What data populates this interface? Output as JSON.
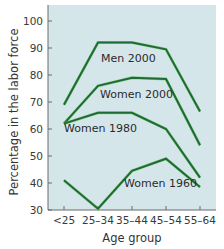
{
  "chart_data": {
    "type": "line",
    "title": "",
    "xlabel": "Age group",
    "ylabel": "Percentage in the labor force",
    "categories": [
      "<25",
      "25–34",
      "35–44",
      "45–54",
      "55–64"
    ],
    "yticks": [
      30,
      40,
      50,
      60,
      70,
      80,
      90,
      100
    ],
    "ylim": [
      30,
      100
    ],
    "grid": false,
    "legend": "inline labels",
    "series": [
      {
        "name": "Men 2000",
        "values": [
          69,
          92,
          92,
          89.5,
          66.5
        ]
      },
      {
        "name": "Women 2000",
        "values": [
          62,
          76,
          79,
          78.5,
          54
        ]
      },
      {
        "name": "Women 1980",
        "values": [
          62,
          66,
          66,
          60,
          42
        ]
      },
      {
        "name": "Women 1960",
        "values": [
          41,
          30.5,
          44.5,
          49,
          38.5
        ]
      }
    ],
    "colors": {
      "plot_background": "#d5e6ea",
      "line": "#1f6b35",
      "line_highlight": "#5cbf4a",
      "axis": "#6a6a6a"
    }
  },
  "labels": {
    "series": [
      {
        "text": "Men 2000",
        "x": 101,
        "y": 62
      },
      {
        "text": "Women 2000",
        "x": 100,
        "y": 98
      },
      {
        "text": "Women 1980",
        "x": 64,
        "y": 132
      },
      {
        "text": "Women 1960",
        "x": 124,
        "y": 187
      }
    ]
  }
}
